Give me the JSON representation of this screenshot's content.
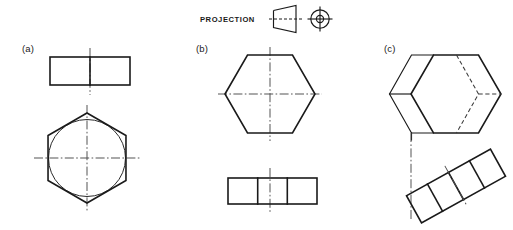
{
  "sheet": {
    "width": 513,
    "height": 230,
    "background": "#ffffff",
    "ink_color": "#1a1a1a",
    "hidden_line_color": "#3a3a3a",
    "center_line_color": "#4a4a4a"
  },
  "projection": {
    "label": "PROJECTION",
    "label_x": 200,
    "label_y": 21,
    "symbol_type": "first-angle-projection-symbol",
    "cone": {
      "name": "truncated-cone-silhouette",
      "points": "272,10 272,28 296,33 296,5",
      "axis_dash_y": 19,
      "axis_dash_x1": 268,
      "axis_dash_x2": 302
    },
    "circles": {
      "name": "concentric-circles",
      "cx": 320,
      "cy": 19,
      "r_outer": 9.2,
      "r_inner": 3.6,
      "crosshair_half": 12.5
    }
  },
  "views": [
    {
      "id": "a",
      "label": "(a)",
      "label_x": 22,
      "label_y": 52,
      "description": "hexagonal prism: rectangular front view over pointy-top hexagon end view with inscribed circle",
      "top_view": {
        "name": "rectangle-two-cells",
        "x": 50,
        "y": 57,
        "width": 80,
        "height": 28,
        "divisions": 2,
        "centerline_x": 90,
        "centerline_y1": 48,
        "centerline_y2": 95
      },
      "bottom_view": {
        "name": "hexagon-pointy-top-with-circle",
        "cx": 87,
        "cy": 158,
        "radius": 45,
        "orientation": "pointy-top",
        "inscribed_circle_radius": 39,
        "centerline_h_x1": 34,
        "centerline_h_x2": 140,
        "centerline_v_y1": 105,
        "centerline_v_y2": 211
      }
    },
    {
      "id": "b",
      "label": "(b)",
      "label_x": 196,
      "label_y": 52,
      "description": "hexagonal prism: flat-top hexagon end view over rectangular front view with three cells",
      "top_view": {
        "name": "hexagon-flat-top",
        "cx": 270,
        "cy": 94,
        "radius": 45,
        "orientation": "flat-top",
        "centerline_h_x1": 218,
        "centerline_h_x2": 322,
        "centerline_v_y1": 47,
        "centerline_v_y2": 141
      },
      "bottom_view": {
        "name": "rectangle-three-cells",
        "x": 228,
        "y": 178,
        "width": 89,
        "height": 26,
        "divisions": 3,
        "centerline_x": 270,
        "centerline_y1": 168,
        "centerline_y2": 214
      }
    },
    {
      "id": "c",
      "label": "(c)",
      "label_x": 384,
      "label_y": 52,
      "description": "pictorial hexagonal prism with hidden edges above a tilted rectangular view with four cells",
      "top_view": {
        "name": "hexagonal-prism-pictorial",
        "cx": 455,
        "cy": 94,
        "radius": 44,
        "orientation": "flat-top",
        "depth_offset_x": -22,
        "depth_offset_y": 0,
        "hidden_edges": true
      },
      "link_centerline": {
        "name": "projection-centerline",
        "x": 411,
        "y1": 133,
        "y2": 219
      },
      "bottom_view": {
        "name": "tilted-rectangle-four-cells",
        "cx": 456,
        "cy": 186,
        "length": 96,
        "thickness": 31,
        "rotation_deg": -29,
        "divisions": 4,
        "cell_centerline_index": 2
      }
    }
  ]
}
